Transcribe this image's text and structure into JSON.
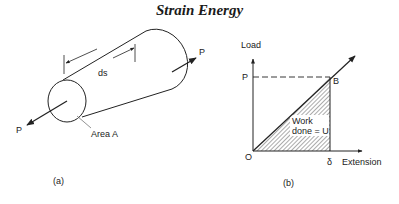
{
  "title": "Strain Energy",
  "figure_a": {
    "caption": "(a)",
    "load_label_left": "P",
    "load_label_right": "P",
    "length_label": "ds",
    "area_label": "Area A"
  },
  "figure_b": {
    "caption": "(b)",
    "y_axis_label": "Load",
    "x_axis_label": "Extension",
    "origin_label": "O",
    "y_tick_label": "P",
    "x_tick_label": "δ",
    "point_label": "B",
    "area_label_line1": "Work",
    "area_label_line2": "done = U"
  },
  "colors": {
    "line": "#222222",
    "hatch": "#444444",
    "background": "#ffffff"
  }
}
